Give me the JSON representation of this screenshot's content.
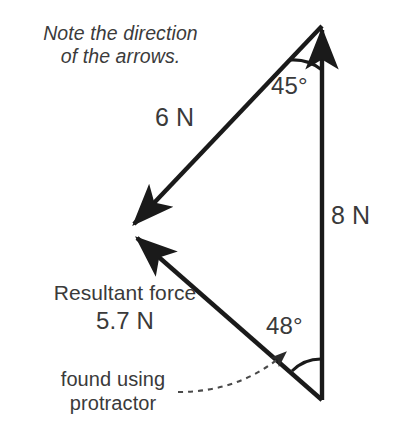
{
  "figure": {
    "kind": "force-vector-triangle-diagram",
    "background_color": "#ffffff",
    "line_color": "#1a1a1a",
    "text_color": "#3a3a3a"
  },
  "note": {
    "line1": "Note the direction",
    "line2": "of the arrows.",
    "full": "Note the direction of the arrows."
  },
  "vectors": {
    "force_6n": {
      "label": "6 N",
      "magnitude": 6,
      "unit": "N",
      "from": [
        322,
        24
      ],
      "to": [
        128,
        228
      ],
      "arrow_at": "to"
    },
    "force_8n": {
      "label": "8 N",
      "magnitude": 8,
      "unit": "N",
      "from": [
        322,
        400
      ],
      "to": [
        322,
        24
      ],
      "arrow_at": "to"
    },
    "resultant": {
      "label_line1": "Resultant force",
      "label_line2": "5.7 N",
      "magnitude": 5.7,
      "unit": "N",
      "from": [
        322,
        400
      ],
      "to": [
        130,
        232
      ],
      "arrow_at": "to"
    }
  },
  "angles": {
    "apex": {
      "label": "45°",
      "value": 45,
      "unit": "degrees",
      "vertex": [
        322,
        24
      ]
    },
    "base": {
      "label": "48°",
      "value": 48,
      "unit": "degrees",
      "vertex": [
        322,
        400
      ]
    }
  },
  "annotation": {
    "line1": "found using",
    "line2": "protractor",
    "full": "found using protractor",
    "points_to": "48°"
  }
}
